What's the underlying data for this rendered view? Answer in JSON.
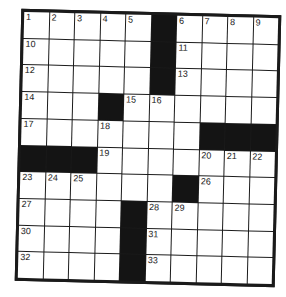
{
  "puzzle": {
    "type": "crossword",
    "rows": 10,
    "cols": 10,
    "grid": [
      [
        "1",
        "2",
        "3",
        "4",
        "5",
        "#",
        "6",
        "7",
        "8",
        "9"
      ],
      [
        "10",
        "",
        "",
        "",
        "",
        "#",
        "11",
        "",
        "",
        ""
      ],
      [
        "12",
        "",
        "",
        "",
        "",
        "#",
        "13",
        "",
        "",
        ""
      ],
      [
        "14",
        "",
        "",
        "#",
        "15",
        "16",
        "",
        "",
        "",
        ""
      ],
      [
        "17",
        "",
        "",
        "18",
        "",
        "",
        "",
        "#",
        "#",
        "#"
      ],
      [
        "#",
        "#",
        "#",
        "19",
        "",
        "",
        "",
        "20",
        "21",
        "22"
      ],
      [
        "23",
        "24",
        "25",
        "",
        "",
        "",
        "#",
        "26",
        "",
        ""
      ],
      [
        "27",
        "",
        "",
        "",
        "#",
        "28",
        "29",
        "",
        "",
        ""
      ],
      [
        "30",
        "",
        "",
        "",
        "#",
        "31",
        "",
        "",
        "",
        ""
      ],
      [
        "32",
        "",
        "",
        "",
        "#",
        "33",
        "",
        "",
        "",
        ""
      ]
    ],
    "colors": {
      "block": "#141414",
      "cell": "#ffffff",
      "border": "#1a1a1a"
    }
  }
}
